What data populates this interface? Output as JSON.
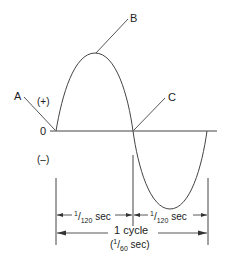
{
  "diagram": {
    "title": "",
    "labels": {
      "point_a": "A",
      "point_b": "B",
      "point_c": "C",
      "positive": "(+)",
      "negative": "(–)",
      "zero": "0"
    },
    "dimensions": {
      "half_cycle_1": {
        "num": "1",
        "den": "120",
        "unit": "sec"
      },
      "half_cycle_2": {
        "num": "1",
        "den": "120",
        "unit": "sec"
      },
      "full_cycle_label": "1 cycle",
      "full_cycle_time": {
        "num": "1",
        "den": "60",
        "unit": "sec"
      }
    },
    "colors": {
      "line": "#333333",
      "background": "#ffffff"
    }
  }
}
